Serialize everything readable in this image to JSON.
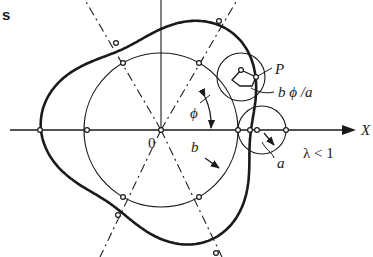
{
  "diagram": {
    "corner_fragment": "s",
    "labels": {
      "origin": "0",
      "point": "P",
      "arc_length": "b ϕ /a",
      "x_axis": "X",
      "angle": "ϕ",
      "fixed_radius": "b",
      "rolling_radius": "a",
      "ratio_condition": "λ < 1"
    },
    "colors": {
      "ink": "#1a1a1a",
      "background": "#ffffff"
    }
  }
}
